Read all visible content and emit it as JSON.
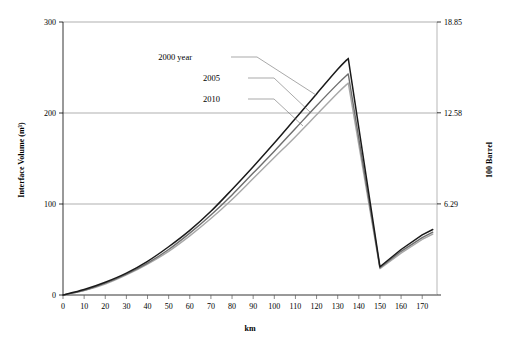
{
  "chart_data": {
    "type": "line",
    "title": "",
    "xlabel": "km",
    "ylabel": "Interface Volume (m³)",
    "y2label": "100 Barrel",
    "grid": true,
    "legend_position": "inline-annotations",
    "xlim": [
      0,
      177
    ],
    "ylim": [
      0,
      300
    ],
    "y2lim": [
      0,
      18.85
    ],
    "xticks": [
      0,
      10,
      20,
      30,
      40,
      50,
      60,
      70,
      80,
      90,
      100,
      110,
      120,
      130,
      140,
      150,
      160,
      170
    ],
    "xtick_labels": [
      "0",
      "10",
      "20",
      "30",
      "40",
      "50",
      "60",
      "70",
      "80",
      "90",
      "100",
      "110",
      "120",
      "130",
      "140",
      "150",
      "160",
      "170"
    ],
    "yticks": [
      0,
      100,
      200,
      300
    ],
    "ytick_labels": [
      "0",
      "100",
      "200",
      "300"
    ],
    "y2ticks": [
      0,
      6.29,
      12.58,
      18.85
    ],
    "y2tick_labels": [
      "",
      "6.29",
      "12.58",
      "18.85"
    ],
    "series": [
      {
        "name": "2000 year",
        "color": "#1a1a1a",
        "width": 1.5,
        "points": [
          [
            0,
            0
          ],
          [
            10,
            6
          ],
          [
            20,
            14
          ],
          [
            30,
            24
          ],
          [
            40,
            37
          ],
          [
            50,
            53
          ],
          [
            60,
            71
          ],
          [
            70,
            92
          ],
          [
            80,
            116
          ],
          [
            90,
            141
          ],
          [
            100,
            167
          ],
          [
            110,
            194
          ],
          [
            120,
            221
          ],
          [
            130,
            248
          ],
          [
            135,
            260
          ],
          [
            150,
            31
          ],
          [
            160,
            50
          ],
          [
            170,
            66
          ],
          [
            175,
            72
          ]
        ]
      },
      {
        "name": "2005",
        "color": "#6e6e6e",
        "width": 1.4,
        "points": [
          [
            0,
            0
          ],
          [
            10,
            5
          ],
          [
            20,
            13
          ],
          [
            30,
            23
          ],
          [
            40,
            35
          ],
          [
            50,
            50
          ],
          [
            60,
            68
          ],
          [
            70,
            88
          ],
          [
            80,
            110
          ],
          [
            90,
            134
          ],
          [
            100,
            158
          ],
          [
            110,
            183
          ],
          [
            120,
            208
          ],
          [
            130,
            232
          ],
          [
            135,
            243
          ],
          [
            150,
            30
          ],
          [
            160,
            48
          ],
          [
            170,
            63
          ],
          [
            175,
            69
          ]
        ]
      },
      {
        "name": "2010",
        "color": "#a8a8a8",
        "width": 1.4,
        "points": [
          [
            0,
            0
          ],
          [
            10,
            5
          ],
          [
            20,
            12
          ],
          [
            30,
            22
          ],
          [
            40,
            34
          ],
          [
            50,
            48
          ],
          [
            60,
            65
          ],
          [
            70,
            84
          ],
          [
            80,
            105
          ],
          [
            90,
            128
          ],
          [
            100,
            151
          ],
          [
            110,
            174
          ],
          [
            120,
            198
          ],
          [
            130,
            222
          ],
          [
            135,
            233
          ],
          [
            150,
            29
          ],
          [
            160,
            46
          ],
          [
            170,
            61
          ],
          [
            175,
            67
          ]
        ]
      }
    ],
    "annotations": [
      {
        "text": "2000 year",
        "label_x": 192,
        "label_y": 60,
        "leader_from_x": 231,
        "leader_from_y": 57,
        "leader_to_x": 316,
        "leader_to_y": 95
      },
      {
        "text": "2005",
        "label_x": 220,
        "label_y": 81,
        "leader_from_x": 248,
        "leader_from_y": 78,
        "leader_to_x": 310,
        "leader_to_y": 112
      },
      {
        "text": "2010",
        "label_x": 220,
        "label_y": 102,
        "leader_from_x": 248,
        "leader_from_y": 99,
        "leader_to_x": 303,
        "leader_to_y": 126
      }
    ]
  }
}
